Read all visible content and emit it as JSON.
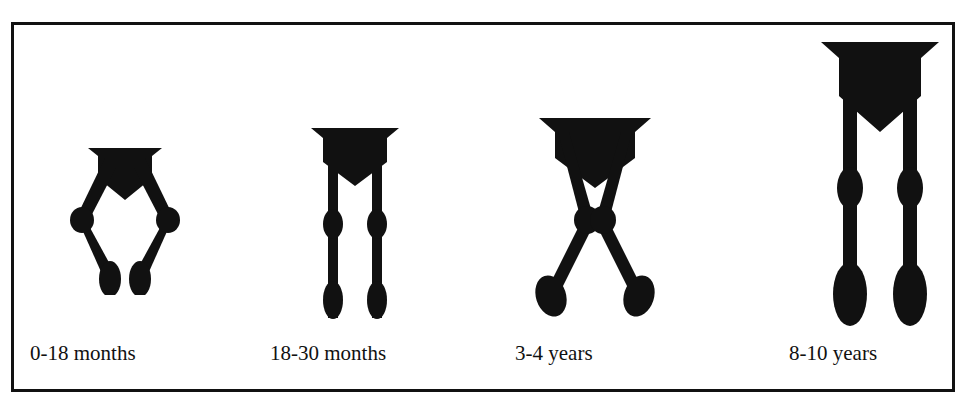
{
  "diagram": {
    "background_color": "#ffffff",
    "ink_color": "#111111",
    "border_color": "#111111",
    "stages": [
      {
        "id": "stage-1",
        "caption": "0-18 months",
        "alignment": "genu varum (bowlegs)",
        "figure_name": "bowlegged-legs-figure"
      },
      {
        "id": "stage-2",
        "caption": "18-30 months",
        "alignment": "neutral / straight",
        "figure_name": "straight-legs-figure"
      },
      {
        "id": "stage-3",
        "caption": "3-4 years",
        "alignment": "genu valgum (knock-knees)",
        "figure_name": "knock-knee-legs-figure"
      },
      {
        "id": "stage-4",
        "caption": "8-10 years",
        "alignment": "mature straight alignment",
        "figure_name": "mature-straight-legs-figure"
      }
    ]
  }
}
